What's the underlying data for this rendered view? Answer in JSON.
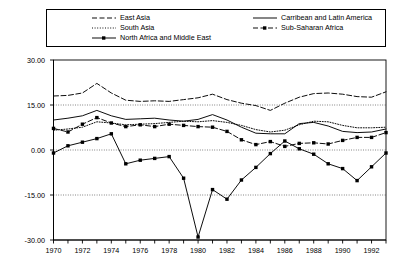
{
  "legend": {
    "entries": [
      {
        "label": "East Asia",
        "style": "dashed",
        "marker": "none",
        "column": 0,
        "row": 0
      },
      {
        "label": "South Asia",
        "style": "dotted",
        "marker": "none",
        "column": 0,
        "row": 1
      },
      {
        "label": "North Africa and Middle East",
        "style": "solid",
        "marker": "square",
        "column": 0,
        "row": 2
      },
      {
        "label": "Carribean and Latin America",
        "style": "solid",
        "marker": "none",
        "column": 1,
        "row": 0
      },
      {
        "label": "Sub-Saharan Africa",
        "style": "dashed",
        "marker": "square",
        "column": 1,
        "row": 1
      }
    ]
  },
  "axes": {
    "y_tick_labels": [
      "30.00",
      "15.00",
      "0.00",
      "-15.00",
      "-30.00"
    ],
    "x_tick_labels": [
      "1970",
      "1972",
      "1974",
      "1976",
      "1978",
      "1980",
      "1982",
      "1984",
      "1986",
      "1988",
      "1990",
      "1992"
    ]
  },
  "chart_data": {
    "type": "line",
    "title": "",
    "xlabel": "",
    "ylabel": "",
    "xlim": [
      1970,
      1993
    ],
    "ylim": [
      -30,
      30
    ],
    "grid": true,
    "legend_position": "top",
    "x": [
      1970,
      1971,
      1972,
      1973,
      1974,
      1975,
      1976,
      1977,
      1978,
      1979,
      1980,
      1981,
      1982,
      1983,
      1984,
      1985,
      1986,
      1987,
      1988,
      1989,
      1990,
      1991,
      1992,
      1993
    ],
    "series": [
      {
        "name": "East Asia",
        "style": "dashed",
        "marker": "none",
        "values": [
          18.0,
          18.2,
          19.0,
          22.2,
          19.0,
          16.6,
          16.2,
          16.4,
          16.2,
          16.8,
          17.4,
          18.6,
          16.8,
          15.6,
          14.8,
          13.2,
          15.6,
          17.6,
          18.8,
          19.0,
          18.6,
          17.8,
          17.6,
          19.4
        ]
      },
      {
        "name": "South Asia",
        "style": "dotted",
        "marker": "none",
        "values": [
          6.6,
          7.0,
          7.6,
          9.4,
          9.0,
          8.4,
          8.6,
          8.8,
          9.2,
          9.6,
          9.4,
          9.8,
          9.2,
          8.2,
          6.8,
          6.0,
          6.6,
          8.4,
          9.6,
          9.4,
          8.2,
          7.4,
          7.4,
          7.6
        ]
      },
      {
        "name": "North Africa and Middle East",
        "style": "solid",
        "marker": "square",
        "values": [
          -1.0,
          1.4,
          2.6,
          3.8,
          5.4,
          -4.6,
          -3.4,
          -2.8,
          -2.2,
          -9.4,
          -29.0,
          -13.2,
          -16.4,
          -10.0,
          -5.8,
          -1.2,
          3.0,
          0.4,
          -1.4,
          -4.6,
          -6.2,
          -10.2,
          -5.6,
          -1.0
        ]
      },
      {
        "name": "Carribean and Latin America",
        "style": "solid",
        "marker": "none",
        "values": [
          10.0,
          10.6,
          11.4,
          13.2,
          11.4,
          10.2,
          10.4,
          10.6,
          10.0,
          9.6,
          10.2,
          11.8,
          10.0,
          7.6,
          5.6,
          5.4,
          5.4,
          8.8,
          9.2,
          8.0,
          6.2,
          5.8,
          6.0,
          7.0
        ]
      },
      {
        "name": "Sub-Saharan Africa",
        "style": "dashed",
        "marker": "square",
        "values": [
          7.2,
          6.0,
          8.6,
          10.8,
          9.0,
          7.8,
          8.4,
          7.8,
          8.6,
          8.2,
          7.8,
          7.6,
          6.2,
          3.4,
          1.8,
          2.8,
          1.2,
          2.2,
          2.4,
          2.0,
          3.2,
          4.2,
          4.2,
          5.8
        ]
      }
    ]
  }
}
